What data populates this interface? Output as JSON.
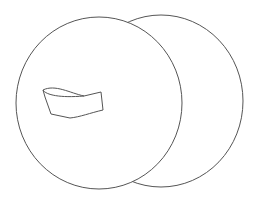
{
  "drawing": {
    "description": "Line drawing of two overlapping discs with a strap handle",
    "stroke_color": "#555555",
    "background": "#ffffff",
    "back_disc": {
      "cx": 161,
      "cy": 101,
      "rx": 82,
      "ry": 86
    },
    "front_disc": {
      "cx": 99,
      "cy": 103,
      "rx": 83,
      "ry": 86
    },
    "strap": {
      "outer_path": "M43,90 C55,84 70,93 84,96 L101,92 L103,110 C90,113 80,117 70,118 L51,114 L45,97 Z",
      "inner_curve": "M43,90 C47,94 60,97 84,96"
    }
  }
}
